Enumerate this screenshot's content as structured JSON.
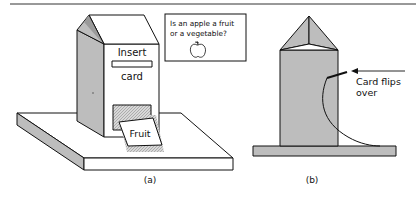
{
  "figure_a": {
    "caption": "(a)",
    "machine": {
      "label_top": "Insert",
      "label_bottom": "card",
      "output_card_label": "Fruit"
    },
    "question_card": {
      "line1": "Is an apple a fruit",
      "line2": "or a vegetable?",
      "icon": "apple-icon"
    }
  },
  "figure_b": {
    "caption": "(b)",
    "annotation_line1": "Card flips",
    "annotation_line2": "over"
  },
  "colors": {
    "shade": "#bdbdbd",
    "stroke": "#111111",
    "background": "#ffffff"
  }
}
